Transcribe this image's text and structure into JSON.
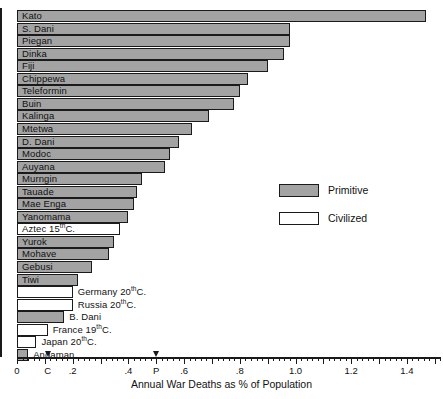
{
  "chart_data": {
    "type": "bar",
    "orientation": "horizontal",
    "title": "",
    "xlabel": "Annual War Deaths as % of Population",
    "ylabel": "",
    "xlim": [
      0,
      1.52
    ],
    "grid": false,
    "legend_position": "right-middle",
    "xticks": [
      "0",
      ".2",
      ".4",
      ".6",
      ".8",
      "1.0",
      "1.2",
      "1.4"
    ],
    "xtick_values": [
      0,
      0.2,
      0.4,
      0.6,
      0.8,
      1.0,
      1.2,
      1.4
    ],
    "markers": [
      {
        "label": "C",
        "value": 0.11,
        "meaning": "civilized-average-marker"
      },
      {
        "label": "P",
        "value": 0.5,
        "meaning": "primitive-average-marker"
      }
    ],
    "series": [
      {
        "name": "Primitive",
        "color": "#a3a3a3"
      },
      {
        "name": "Civilized",
        "color": "#ffffff"
      }
    ],
    "categories": [
      "Kato",
      "S. Dani",
      "Piegan",
      "Dinka",
      "Fiji",
      "Chippewa",
      "Teleformin",
      "Buin",
      "Kalinga",
      "Mtetwa",
      "D. Dani",
      "Modoc",
      "Auyana",
      "Murngin",
      "Tauade",
      "Mae Enga",
      "Yanomama",
      "Aztec 15th C.",
      "Yurok",
      "Mohave",
      "Gebusi",
      "Tiwi",
      "Germany 20th C.",
      "Russia 20th C.",
      "B. Dani",
      "France 19th C.",
      "Japan 20th C.",
      "Andaman"
    ],
    "values": [
      1.47,
      0.98,
      0.98,
      0.96,
      0.9,
      0.83,
      0.8,
      0.78,
      0.69,
      0.63,
      0.58,
      0.55,
      0.53,
      0.45,
      0.43,
      0.42,
      0.4,
      0.37,
      0.35,
      0.33,
      0.27,
      0.22,
      0.2,
      0.2,
      0.17,
      0.11,
      0.07,
      0.04
    ]
  },
  "bars": [
    {
      "label": "Kato",
      "sup": "",
      "value": 1.47,
      "group": "primitive",
      "label_pos": "inside"
    },
    {
      "label": "S. Dani",
      "sup": "",
      "value": 0.98,
      "group": "primitive",
      "label_pos": "inside"
    },
    {
      "label": "Piegan",
      "sup": "",
      "value": 0.98,
      "group": "primitive",
      "label_pos": "inside"
    },
    {
      "label": "Dinka",
      "sup": "",
      "value": 0.96,
      "group": "primitive",
      "label_pos": "inside"
    },
    {
      "label": "Fiji",
      "sup": "",
      "value": 0.9,
      "group": "primitive",
      "label_pos": "inside"
    },
    {
      "label": "Chippewa",
      "sup": "",
      "value": 0.83,
      "group": "primitive",
      "label_pos": "inside"
    },
    {
      "label": "Teleformin",
      "sup": "",
      "value": 0.8,
      "group": "primitive",
      "label_pos": "inside"
    },
    {
      "label": "Buin",
      "sup": "",
      "value": 0.78,
      "group": "primitive",
      "label_pos": "inside"
    },
    {
      "label": "Kalinga",
      "sup": "",
      "value": 0.69,
      "group": "primitive",
      "label_pos": "inside"
    },
    {
      "label": "Mtetwa",
      "sup": "",
      "value": 0.63,
      "group": "primitive",
      "label_pos": "inside"
    },
    {
      "label": "D. Dani",
      "sup": "",
      "value": 0.58,
      "group": "primitive",
      "label_pos": "inside"
    },
    {
      "label": "Modoc",
      "sup": "",
      "value": 0.55,
      "group": "primitive",
      "label_pos": "inside"
    },
    {
      "label": "Auyana",
      "sup": "",
      "value": 0.53,
      "group": "primitive",
      "label_pos": "inside"
    },
    {
      "label": "Murngin",
      "sup": "",
      "value": 0.45,
      "group": "primitive",
      "label_pos": "inside"
    },
    {
      "label": "Tauade",
      "sup": "",
      "value": 0.43,
      "group": "primitive",
      "label_pos": "inside"
    },
    {
      "label": "Mae Enga",
      "sup": "",
      "value": 0.42,
      "group": "primitive",
      "label_pos": "inside"
    },
    {
      "label": "Yanomama",
      "sup": "",
      "value": 0.4,
      "group": "primitive",
      "label_pos": "inside"
    },
    {
      "label": "Aztec 15",
      "sup": "th",
      "tail": "C.",
      "value": 0.37,
      "group": "civilized",
      "label_pos": "inside"
    },
    {
      "label": "Yurok",
      "sup": "",
      "value": 0.35,
      "group": "primitive",
      "label_pos": "inside"
    },
    {
      "label": "Mohave",
      "sup": "",
      "value": 0.33,
      "group": "primitive",
      "label_pos": "inside"
    },
    {
      "label": "Gebusi",
      "sup": "",
      "value": 0.27,
      "group": "primitive",
      "label_pos": "inside"
    },
    {
      "label": "Tiwi",
      "sup": "",
      "value": 0.22,
      "group": "primitive",
      "label_pos": "inside"
    },
    {
      "label": "Germany 20",
      "sup": "th",
      "tail": "C.",
      "value": 0.2,
      "group": "civilized",
      "label_pos": "outside"
    },
    {
      "label": "Russia 20",
      "sup": "th",
      "tail": "C.",
      "value": 0.2,
      "group": "civilized",
      "label_pos": "outside"
    },
    {
      "label": "B. Dani",
      "sup": "",
      "value": 0.17,
      "group": "primitive",
      "label_pos": "outside"
    },
    {
      "label": "France 19",
      "sup": "th",
      "tail": "C.",
      "value": 0.11,
      "group": "civilized",
      "label_pos": "outside"
    },
    {
      "label": "Japan 20",
      "sup": "th",
      "tail": "C.",
      "value": 0.07,
      "group": "civilized",
      "label_pos": "outside"
    },
    {
      "label": "Andaman",
      "sup": "",
      "value": 0.04,
      "group": "primitive",
      "label_pos": "outside"
    }
  ],
  "legend": {
    "items": [
      {
        "label": "Primitive",
        "group": "primitive"
      },
      {
        "label": "Civilized",
        "group": "civilized"
      }
    ]
  },
  "axis": {
    "title": "Annual War Deaths as % of Population",
    "ticks": [
      {
        "label": "0",
        "value": 0.0
      },
      {
        "label": ".2",
        "value": 0.2
      },
      {
        "label": ".4",
        "value": 0.4
      },
      {
        "label": ".6",
        "value": 0.6
      },
      {
        "label": ".8",
        "value": 0.8
      },
      {
        "label": "1.0",
        "value": 1.0
      },
      {
        "label": "1.2",
        "value": 1.2
      },
      {
        "label": "1.4",
        "value": 1.4
      }
    ],
    "markers": [
      {
        "label": "C",
        "value": 0.11
      },
      {
        "label": "P",
        "value": 0.5
      }
    ]
  }
}
